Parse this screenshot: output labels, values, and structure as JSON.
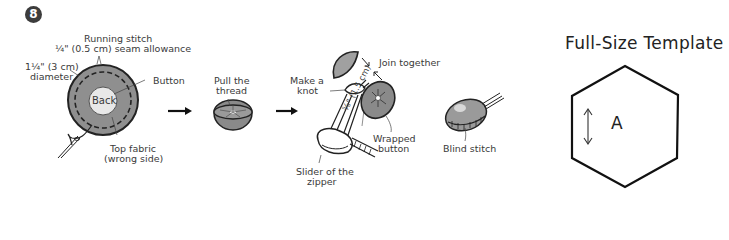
{
  "step": {
    "number": "8",
    "labels": {
      "running_stitch": "Running stitch",
      "seam_allowance": "¼\" (0.5 cm) seam allowance",
      "diameter_line1": "1¼\" (3 cm)",
      "diameter_line2": "diameter",
      "button": "Button",
      "back": "Back",
      "top_fabric_line1": "Top fabric",
      "top_fabric_line2": "(wrong side)",
      "pull_line1": "Pull the",
      "pull_line2": "thread",
      "make_knot_line1": "Make a",
      "make_knot_line2": "knot",
      "join_together": "Join together",
      "measure": "⅝\" (1.5 cm)",
      "wrapped_line1": "Wrapped",
      "wrapped_line2": "button",
      "slider_line1": "Slider of the",
      "slider_line2": "zipper",
      "blind_stitch": "Blind stitch"
    }
  },
  "template": {
    "title": "Full-Size Template",
    "piece_label": "A",
    "grain_arrow": "double-headed vertical arrow",
    "shape": "hexagon"
  },
  "colors": {
    "fabric_gray": "#8a8a8a",
    "outline": "#222222",
    "badge": "#3c3c3c"
  }
}
